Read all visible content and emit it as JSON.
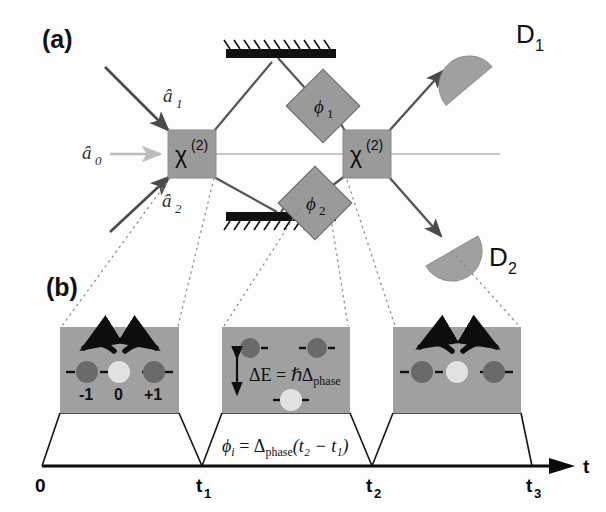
{
  "figure": {
    "width": 606,
    "height": 512,
    "background": "#fdfdfd"
  },
  "colors": {
    "crystal_fill": "#9a9a9a",
    "phase_fill": "#9a9a9a",
    "detector_fill": "#a0a0a0",
    "inset_fill": "#a0a0a0",
    "beam_dark": "#4a4a4a",
    "beam_light": "#bdbdbd",
    "mirror": "#101010",
    "dotted_guide": "#8c8c8c",
    "level_dark": "#6a6a6a",
    "level_light": "#e2e2e2",
    "arrow_black": "#0d0d0d",
    "axis": "#0a0a0a",
    "text": "#111111"
  },
  "panels": {
    "a": {
      "label": "(a)",
      "label_x": 42,
      "label_y": 48
    },
    "b": {
      "label": "(b)",
      "label_x": 46,
      "label_y": 296
    }
  },
  "optics": {
    "crystals": [
      {
        "name": "crystal-1",
        "symbol": "χ",
        "superscript": "(2)",
        "x": 168,
        "y": 130,
        "w": 48,
        "h": 48
      },
      {
        "name": "crystal-2",
        "symbol": "χ",
        "superscript": "(2)",
        "x": 343,
        "y": 130,
        "w": 48,
        "h": 48
      }
    ],
    "phase_shifters": [
      {
        "name": "phase-shifter-1",
        "symbol": "ϕ",
        "subscript": "1",
        "cx": 323,
        "cy": 106,
        "half": 26
      },
      {
        "name": "phase-shifter-2",
        "symbol": "ϕ",
        "subscript": "2",
        "cx": 315,
        "cy": 203,
        "half": 26
      }
    ],
    "mirrors": [
      {
        "name": "mirror-top",
        "x": 226,
        "y": 49,
        "w": 110,
        "h": 9,
        "hatch_above": true
      },
      {
        "name": "mirror-bottom",
        "x": 226,
        "y": 212,
        "w": 110,
        "h": 9,
        "hatch_above": false
      }
    ],
    "detectors": [
      {
        "name": "detector-1",
        "label": "D",
        "subscript": "1",
        "cx": 469,
        "cy": 56,
        "r": 30,
        "rotate": -35,
        "label_x": 516,
        "label_y": 43
      },
      {
        "name": "detector-2",
        "label": "D",
        "subscript": "2",
        "cx": 452,
        "cy": 251,
        "r": 30,
        "rotate": 150,
        "label_x": 489,
        "label_y": 266
      }
    ],
    "input_modes": [
      {
        "name": "input-a1",
        "label": "â",
        "subscript": "1",
        "label_x": 163,
        "label_y": 102,
        "color": "#4a4a4a"
      },
      {
        "name": "input-a0",
        "label": "â",
        "subscript": "0",
        "label_x": 82,
        "label_y": 159,
        "color": "#bdbdbd"
      },
      {
        "name": "input-a2",
        "label": "â",
        "subscript": "2",
        "label_x": 162,
        "label_y": 207,
        "color": "#4a4a4a"
      }
    ]
  },
  "timeline": {
    "axis_label": "t",
    "ticks": [
      {
        "name": "tick-0",
        "label": "0",
        "subscript": "",
        "x": 42
      },
      {
        "name": "tick-t1",
        "label": "t",
        "subscript": "1",
        "x": 202
      },
      {
        "name": "tick-t2",
        "label": "t",
        "subscript": "2",
        "x": 372
      },
      {
        "name": "tick-t3",
        "label": "t",
        "subscript": "3",
        "x": 532
      }
    ],
    "formula": {
      "phi": "ϕ",
      "phi_sub": "i",
      "equals": " = ",
      "delta": "Δ",
      "delta_sub": "phase",
      "argument": "(t₂ − t₁)",
      "full_text": "ϕᵢ = Δphase(t₂ − t₁)"
    }
  },
  "insets": [
    {
      "name": "inset-1",
      "x": 60,
      "y": 327,
      "w": 119,
      "h": 86,
      "type": "three-level-degenerate",
      "levels": [
        {
          "name": "level-minus-one",
          "label": "-1",
          "shade": "dark"
        },
        {
          "name": "level-zero",
          "label": "0",
          "shade": "light"
        },
        {
          "name": "level-plus-one",
          "label": "+1",
          "shade": "dark"
        }
      ],
      "show_labels": true,
      "curved_arrows": 2,
      "energy_annotation": null
    },
    {
      "name": "inset-2",
      "x": 222,
      "y": 327,
      "w": 128,
      "h": 86,
      "type": "split-levels",
      "levels": [
        {
          "name": "level-minus-one",
          "label": "",
          "shade": "dark"
        },
        {
          "name": "level-plus-one",
          "label": "",
          "shade": "dark"
        },
        {
          "name": "level-zero",
          "label": "",
          "shade": "light"
        }
      ],
      "show_labels": false,
      "curved_arrows": 0,
      "energy_annotation": {
        "name": "energy-gap-annotation",
        "delta_e": "ΔE",
        "equals": " = ",
        "hbar": "ℏΔ",
        "subscript": "phase",
        "full_text": "ΔE = ℏΔphase"
      }
    },
    {
      "name": "inset-3",
      "x": 393,
      "y": 327,
      "w": 128,
      "h": 86,
      "type": "three-level-degenerate",
      "levels": [
        {
          "name": "level-minus-one",
          "label": "",
          "shade": "dark"
        },
        {
          "name": "level-zero",
          "label": "",
          "shade": "light"
        },
        {
          "name": "level-plus-one",
          "label": "",
          "shade": "dark"
        }
      ],
      "show_labels": false,
      "curved_arrows": 2,
      "energy_annotation": null
    }
  ]
}
